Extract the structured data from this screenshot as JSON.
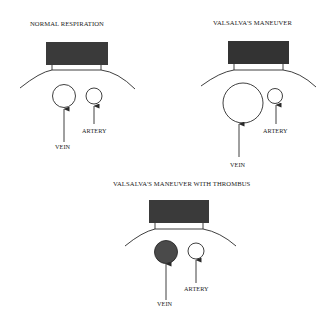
{
  "colors": {
    "probe": "#3a3a3a",
    "thrombus": "#4a4a4a",
    "line": "#2a2a2a",
    "background": "#ffffff"
  },
  "panels": [
    {
      "title": "NORMAL RESPIRATION",
      "vein_label": "VEIN",
      "artery_label": "ARTERY",
      "vein_state": "normal"
    },
    {
      "title": "VALSALVA'S MANEUVER",
      "vein_label": "VEIN",
      "artery_label": "ARTERY",
      "vein_state": "distended"
    },
    {
      "title": "VALSALVA'S MANEUVER WITH THROMBUS",
      "vein_label": "VEIN",
      "artery_label": "ARTERY",
      "vein_state": "thrombosed"
    }
  ]
}
